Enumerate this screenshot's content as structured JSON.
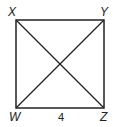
{
  "diagram": {
    "type": "square with diagonals",
    "vertices": [
      {
        "label": "X",
        "position": "top-left"
      },
      {
        "label": "Y",
        "position": "top-right"
      },
      {
        "label": "Z",
        "position": "bottom-right"
      },
      {
        "label": "W",
        "position": "bottom-left"
      }
    ],
    "side_label": {
      "text": "4",
      "side": "WZ"
    },
    "diagonals": [
      "XZ",
      "WY"
    ]
  },
  "labels": {
    "x": "X",
    "y": "Y",
    "w": "W",
    "z": "Z",
    "side": "4"
  },
  "colors": {
    "stroke": "#222222",
    "background": "#ffffff"
  }
}
